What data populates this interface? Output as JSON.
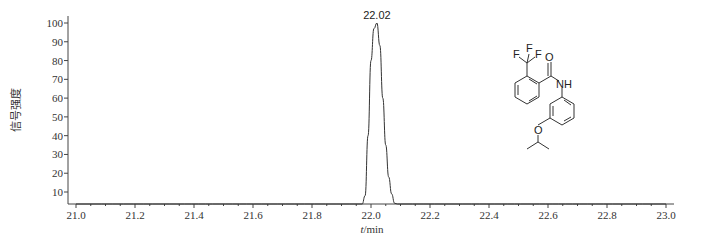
{
  "chart_data": {
    "type": "line",
    "title": "",
    "xlabel": "t/min",
    "ylabel": "信号强度",
    "xlim": [
      21.0,
      23.0
    ],
    "ylim": [
      0,
      100
    ],
    "x_ticks": [
      "21.0",
      "21.2",
      "21.4",
      "21.6",
      "21.8",
      "22.0",
      "22.2",
      "22.4",
      "22.6",
      "22.8",
      "23.0"
    ],
    "y_ticks": [
      "10",
      "20",
      "30",
      "40",
      "50",
      "60",
      "70",
      "80",
      "90",
      "100"
    ],
    "grid": false,
    "legend": null,
    "series": [
      {
        "name": "chromatogram",
        "x": [
          21.0,
          21.97,
          21.98,
          21.99,
          22.0,
          22.01,
          22.02,
          22.03,
          22.04,
          22.05,
          22.06,
          22.07,
          22.08,
          22.09,
          22.1,
          23.0
        ],
        "y": [
          0,
          0,
          8,
          40,
          80,
          97,
          100,
          88,
          60,
          35,
          18,
          9,
          4,
          1.5,
          0,
          0
        ]
      }
    ],
    "annotations": [
      {
        "text": "22.02",
        "x": 22.02,
        "y": 100,
        "type": "peak-label"
      }
    ],
    "inset": {
      "type": "chemical-structure",
      "labels": [
        "F",
        "F",
        "F",
        "O",
        "NH",
        "O"
      ],
      "description": "N-(3-isopropoxyphenyl)-2-(trifluoromethyl)benzamide"
    }
  },
  "labels": {
    "peak": "22.02",
    "xlabel_italic": "t",
    "xlabel_rest": "/min",
    "ylabel": "信号强度",
    "atoms": {
      "f1": "F",
      "f2": "F",
      "f3": "F",
      "o_carbonyl": "O",
      "nh": "NH",
      "o_ether": "O"
    }
  }
}
